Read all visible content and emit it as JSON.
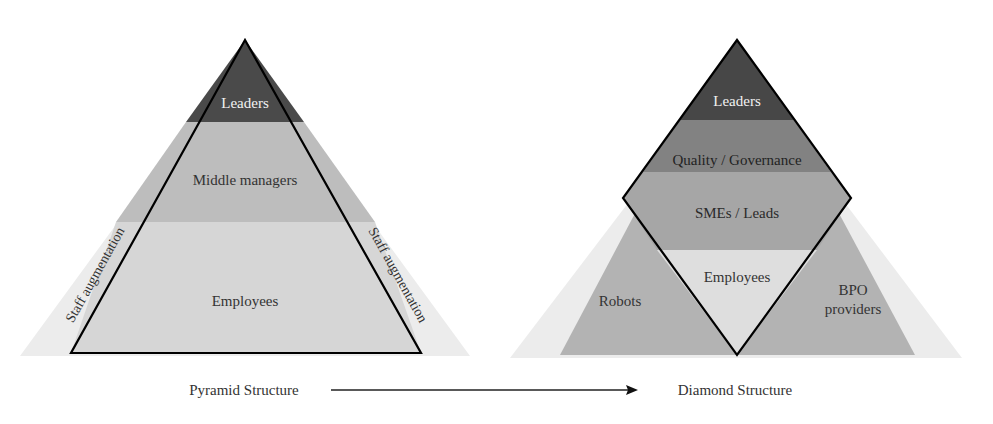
{
  "pyramid": {
    "caption": "Pyramid Structure",
    "layers": [
      {
        "label": "Leaders",
        "color": "#4a4a4a",
        "text_color": "#f2f2f2"
      },
      {
        "label": "Middle managers",
        "color": "#bdbdbd",
        "text_color": "#333333"
      },
      {
        "label": "Employees",
        "color": "#d6d6d6",
        "text_color": "#333333"
      }
    ],
    "side_labels": {
      "left": "Staff augmentation",
      "right": "Staff augmentation"
    },
    "halo_color": "#ececec",
    "outline_color": "#000000"
  },
  "diamond": {
    "caption": "Diamond Structure",
    "layers": [
      {
        "label": "Leaders",
        "color": "#474747",
        "text_color": "#f2f2f2"
      },
      {
        "label": "Quality / Governance",
        "color": "#828282",
        "text_color": "#222222"
      },
      {
        "label": "SMEs / Leads",
        "color": "#a6a6a6",
        "text_color": "#2a2a2a"
      },
      {
        "label": "Employees",
        "color": "#dedede",
        "text_color": "#333333"
      }
    ],
    "outer_labels": {
      "left": "Robots",
      "right_line1": "BPO",
      "right_line2": "providers"
    },
    "outer_color": "#b3b3b3",
    "halo_color": "#ececec",
    "outline_color": "#000000"
  },
  "transition_arrow": {
    "color": "#000000"
  }
}
